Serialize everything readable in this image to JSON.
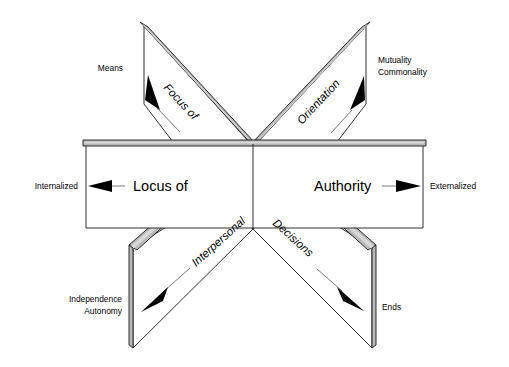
{
  "figure": {
    "center": {
      "x": 253,
      "y": 142
    },
    "colors": {
      "ribbon_fill": "#b9b9b9",
      "ribbon_highlight": "#d8d8d8",
      "panel_fill": "#ffffff",
      "outline": "#1a1a1a",
      "arrow": "#000000",
      "background": "#ffffff"
    }
  },
  "axes": [
    {
      "id": "focus-of",
      "axis_label": "Focus of",
      "style": "italic-rotated",
      "direction": "upper-left",
      "pole_label": "Means",
      "pole_lines": [
        "Means"
      ],
      "arrow": "up-left"
    },
    {
      "id": "orientation",
      "axis_label": "Orientation",
      "style": "italic-rotated",
      "direction": "upper-right",
      "pole_label": "Mutuality Commonality",
      "pole_lines": [
        "Mutuality",
        "Commonality"
      ],
      "arrow": "up-right"
    },
    {
      "id": "locus-of-authority",
      "axis_label": "Locus of Authority",
      "style": "upright-large",
      "direction": "horizontal",
      "left_term": "Locus of",
      "right_term": "Authority",
      "left_pole_label": "Internalized",
      "right_pole_label": "Externalized",
      "pole_lines": [
        "Internalized",
        "Externalized"
      ],
      "arrow": "both"
    },
    {
      "id": "interpersonal",
      "axis_label": "Interpersonal",
      "style": "italic-rotated",
      "direction": "lower-left",
      "pole_label": "Independence Autonomy",
      "pole_lines": [
        "Independence",
        "Autonomy"
      ],
      "arrow": "down-left"
    },
    {
      "id": "decisions",
      "axis_label": "Decisions",
      "style": "italic-rotated",
      "direction": "lower-right",
      "pole_label": "Ends",
      "pole_lines": [
        "Ends"
      ],
      "arrow": "down-right"
    }
  ],
  "labels": {
    "means": "Means",
    "mutuality": "Mutuality",
    "commonality": "Commonality",
    "internalized": "Internalized",
    "externalized": "Externalized",
    "independence": "Independence",
    "autonomy": "Autonomy",
    "ends": "Ends",
    "focus_of": "Focus of",
    "orientation": "Orientation",
    "locus_of": "Locus of",
    "authority": "Authority",
    "interpersonal": "Interpersonal",
    "decisions": "Decisions"
  }
}
